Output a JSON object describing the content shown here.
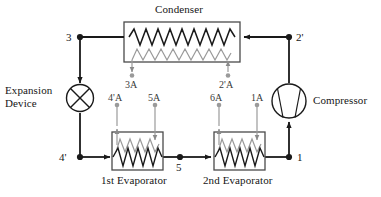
{
  "diagram": {
    "components": {
      "condenser": {
        "label": "Condenser",
        "type": "heat-exchanger",
        "inlet_node": "2'",
        "outlet_node": "3",
        "secondary_inlet": "2'A",
        "secondary_outlet": "3A"
      },
      "expansion_device": {
        "label_line1": "Expansion",
        "label_line2": "Device",
        "type": "expansion-valve",
        "inlet_node": "3",
        "outlet_node": "4'"
      },
      "evaporator1": {
        "label": "1st Evaporator",
        "type": "heat-exchanger",
        "inlet_node": "4'",
        "outlet_node": "5",
        "secondary_inlet": "5A",
        "secondary_outlet": "4'A"
      },
      "evaporator2": {
        "label": "2nd Evaporator",
        "type": "heat-exchanger",
        "inlet_node": "5",
        "outlet_node": "1",
        "secondary_inlet": "1A",
        "secondary_outlet": "6A"
      },
      "compressor": {
        "label": "Compressor",
        "type": "compressor",
        "inlet_node": "1",
        "outlet_node": "2'"
      }
    },
    "state_points": [
      {
        "id": "n1",
        "label": "1",
        "x": 305,
        "y": 157
      },
      {
        "id": "n2p",
        "label": "2'",
        "x": 296,
        "y": 31
      },
      {
        "id": "n3",
        "label": "3",
        "x": 66,
        "y": 31
      },
      {
        "id": "n4p",
        "label": "4'",
        "x": 59,
        "y": 151
      },
      {
        "id": "n5",
        "label": "5",
        "x": 176,
        "y": 161
      }
    ],
    "sensor_points": [
      {
        "id": "s3A",
        "label": "3A",
        "x": 128,
        "y": 78
      },
      {
        "id": "s2pA",
        "label": "2'A",
        "x": 220,
        "y": 78
      },
      {
        "id": "s4pA",
        "label": "4'A",
        "x": 103,
        "y": 96
      },
      {
        "id": "s5A",
        "label": "5A",
        "x": 143,
        "y": 96
      },
      {
        "id": "s6A",
        "label": "6A",
        "x": 215,
        "y": 96
      },
      {
        "id": "s1A",
        "label": "1A",
        "x": 252,
        "y": 96
      }
    ],
    "colors": {
      "refrigerant_line": "#1a1a1a",
      "secondary_line": "#8a8a8a",
      "box_outline": "#4a4a4a",
      "background": "#ffffff",
      "text": "#161616"
    }
  }
}
